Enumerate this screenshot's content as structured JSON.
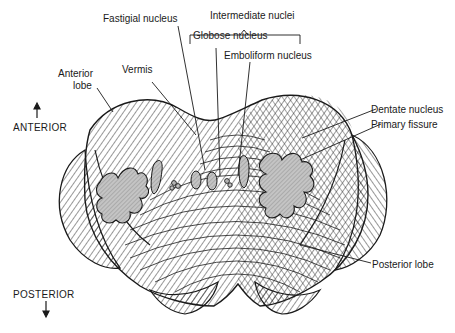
{
  "figure": {
    "colors": {
      "ink": "#1a1a1a",
      "nucleus_fill": "#bdbdbd",
      "background": "#ffffff"
    }
  },
  "orientation": {
    "anterior": "ANTERIOR",
    "posterior": "POSTERIOR"
  },
  "labels": {
    "fastigial": "Fastigial nucleus",
    "intermediate": "Intermediate nuclei",
    "globose": "Globose nucleus",
    "emboliform": "Emboliform nucleus",
    "vermis": "Vermis",
    "anterior_lobe_1": "Anterior",
    "anterior_lobe_2": "lobe",
    "dentate": "Dentate nucleus",
    "primary_fissure": "Primary fissure",
    "posterior_lobe": "Posterior lobe"
  }
}
